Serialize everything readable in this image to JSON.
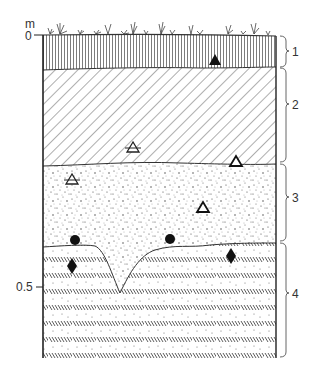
{
  "diagram": {
    "type": "soil-profile",
    "axis": {
      "unit_label": "m",
      "ticks": [
        {
          "label": "0",
          "depth_m": 0
        },
        {
          "label": "0.5",
          "depth_m": 0.5
        }
      ]
    },
    "layers": [
      {
        "id": "1",
        "label": "1",
        "pattern": "vertical-lines",
        "description": "topsoil with grass vegetation at surface"
      },
      {
        "id": "2",
        "label": "2",
        "pattern": "diagonal-hatch"
      },
      {
        "id": "3",
        "label": "3",
        "pattern": "stipple"
      },
      {
        "id": "4",
        "label": "4",
        "pattern": "slanted-dash-rows"
      }
    ],
    "symbols": [
      {
        "shape": "triangle-filled",
        "layer": "2"
      },
      {
        "shape": "triangle-hollow-striped",
        "layer": "2"
      },
      {
        "shape": "triangle-hollow",
        "layer": "2/3 boundary"
      },
      {
        "shape": "triangle-hollow-striped",
        "layer": "3"
      },
      {
        "shape": "triangle-hollow",
        "layer": "3"
      },
      {
        "shape": "circle-filled",
        "layer": "3"
      },
      {
        "shape": "circle-filled",
        "layer": "3"
      },
      {
        "shape": "diamond-filled",
        "layer": "4"
      },
      {
        "shape": "diamond-filled",
        "layer": "4"
      }
    ],
    "colors": {
      "ink": "#222222",
      "background": "#ffffff"
    }
  }
}
